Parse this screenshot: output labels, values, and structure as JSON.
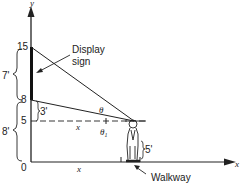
{
  "diagram": {
    "axes": {
      "y_label": "y",
      "x_label": "x",
      "origin_label": "0",
      "y_ticks": [
        "15",
        "8",
        "5"
      ]
    },
    "labels": {
      "display_sign": [
        "Display",
        "sign"
      ],
      "walkway": "Walkway",
      "sign_height": "7'",
      "sign_bottom_height": "8'",
      "gap_above_eye": "3'",
      "eye_height": "5'",
      "horizontal_distance_dashed": "x",
      "horizontal_distance_ground": "x",
      "angle_theta": "θ",
      "angle_theta1": "θ",
      "angle_theta1_sub": "1"
    },
    "colors": {
      "line": "#222222",
      "background": "#ffffff"
    }
  }
}
